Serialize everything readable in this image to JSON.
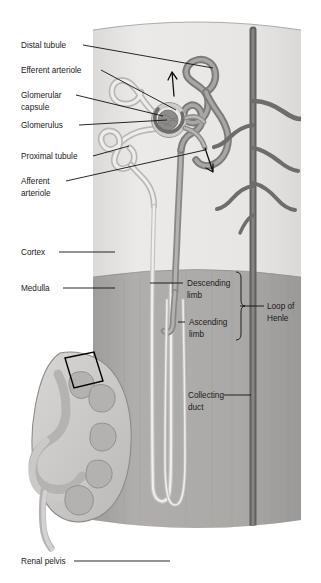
{
  "figure": {
    "type": "anatomical-illustration"
  },
  "labels": {
    "distal_tubule": "Distal tubule",
    "efferent_arteriole": "Efferent arteriole",
    "glomerular_capsule_l1": "Glomerular",
    "glomerular_capsule_l2": "capsule",
    "glomerulus": "Glomerulus",
    "proximal_tubule": "Proximal tubule",
    "afferent_arteriole_l1": "Afferent",
    "afferent_arteriole_l2": "arteriole",
    "cortex": "Cortex",
    "medulla": "Medulla",
    "descending_limb_l1": "Descending",
    "descending_limb_l2": "limb",
    "ascending_limb_l1": "Ascending",
    "ascending_limb_l2": "limb",
    "loop_of_henle_l1": "Loop of",
    "loop_of_henle_l2": "Henle",
    "collecting_duct_l1": "Collecting",
    "collecting_duct_l2": "duct",
    "renal_pelvis": "Renal pelvis"
  },
  "colors": {
    "background": "#ffffff",
    "cortex": "#e6e4e2",
    "medulla": "#a9a7a5",
    "medulla_deep": "#9c9a98",
    "tubule_dark": "#8d8b89",
    "tubule_light": "#d8d6d4",
    "vessel_dark": "#6f6d6b",
    "vessel_mid": "#8a8886",
    "kidney_fill": "#cfcdcb",
    "kidney_medulla": "#bdbbb9",
    "outline": "#7a7876",
    "leader": "#111111",
    "text": "#1a1a1a"
  }
}
